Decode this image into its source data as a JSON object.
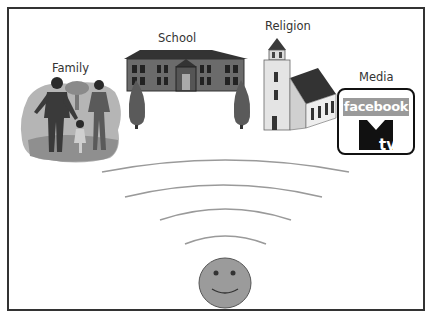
{
  "diagram": {
    "type": "socialization-influences",
    "labels": {
      "family": "Family",
      "school": "School",
      "religion": "Religion",
      "media": "Media"
    },
    "media_logos": {
      "facebook": "facebook",
      "mtv": "MTV"
    },
    "center": {
      "icon": "smiley-face-icon",
      "description": "individual"
    },
    "waves": 4,
    "colors": {
      "frame": "#333333",
      "wave": "#999999",
      "smiley_fill": "#9b9b9b",
      "building_dark": "#3a3a3a",
      "facebook_bg": "#9a9a9a"
    }
  }
}
